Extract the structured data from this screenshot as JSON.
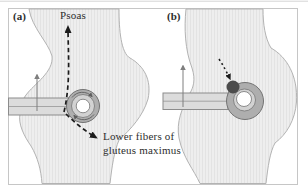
{
  "figure": {
    "type": "anatomical-diagram",
    "description_visible_text_only": true,
    "frame_border_color": "#c6c6c6",
    "page_background": "#ffffff",
    "top_rule_color": "#d4d4d4"
  },
  "panels": [
    {
      "id": "a",
      "label": "(a)",
      "annotations": {
        "psoas": "Psoas",
        "lower_fibers_line1": "Lower fibers of",
        "lower_fibers_line2": "gluteus maximus"
      }
    },
    {
      "id": "b",
      "label": "(b)"
    }
  ],
  "colors": {
    "body_fill": "#eeeeee",
    "body_stripe": "#e3e3e3",
    "body_stroke": "#b3b3b3",
    "band_fill": "#dcdcdc",
    "band_stroke": "#8c8c8c",
    "ring_outer_fill": "#aeaeae",
    "ring_mid_fill": "#d2d2d2",
    "ring_stroke": "#737373",
    "ring_center_fill": "#ffffff",
    "injection_dot_fill": "#4c4c4c",
    "dashed_arrow_color": "#1c1c1c",
    "traction_arrow_color": "#7f7f7f",
    "label_text_color": "#2d2d2d"
  }
}
